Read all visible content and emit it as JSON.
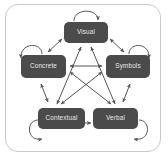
{
  "diagram": {
    "type": "node-link-diagram",
    "background_color": "#ffffff",
    "frame_border_color": "#c9c9c9",
    "node_fill_color": "#4b4b4b",
    "node_text_color": "#e8e8e8",
    "arrow_color": "#55555a",
    "nodes": [
      {
        "id": "visual",
        "label": "Visual",
        "position": "top"
      },
      {
        "id": "concrete",
        "label": "Concrete",
        "position": "left"
      },
      {
        "id": "symbols",
        "label": "Symbols",
        "position": "right"
      },
      {
        "id": "contextual",
        "label": "Contextual",
        "position": "bottom-left"
      },
      {
        "id": "verbal",
        "label": "Verbal",
        "position": "bottom-right"
      }
    ],
    "self_loops": [
      {
        "node": "visual",
        "label": "self-loop-visual"
      },
      {
        "node": "concrete",
        "label": "self-loop-concrete"
      },
      {
        "node": "symbols",
        "label": "self-loop-symbols"
      },
      {
        "node": "contextual",
        "label": "self-loop-contextual"
      },
      {
        "node": "verbal",
        "label": "self-loop-verbal"
      }
    ],
    "perimeter_edges": [
      {
        "from": "concrete",
        "to": "visual",
        "type": "bidirectional"
      },
      {
        "from": "visual",
        "to": "symbols",
        "type": "bidirectional"
      },
      {
        "from": "concrete",
        "to": "contextual",
        "type": "bidirectional"
      },
      {
        "from": "symbols",
        "to": "verbal",
        "type": "bidirectional"
      },
      {
        "from": "contextual",
        "to": "verbal",
        "type": "bidirectional"
      }
    ],
    "diagonal_edges": [
      {
        "from": "visual",
        "to": "contextual",
        "type": "bidirectional"
      },
      {
        "from": "visual",
        "to": "verbal",
        "type": "bidirectional"
      },
      {
        "from": "concrete",
        "to": "symbols",
        "type": "bidirectional"
      },
      {
        "from": "concrete",
        "to": "verbal",
        "type": "bidirectional"
      },
      {
        "from": "symbols",
        "to": "contextual",
        "type": "bidirectional"
      }
    ]
  }
}
